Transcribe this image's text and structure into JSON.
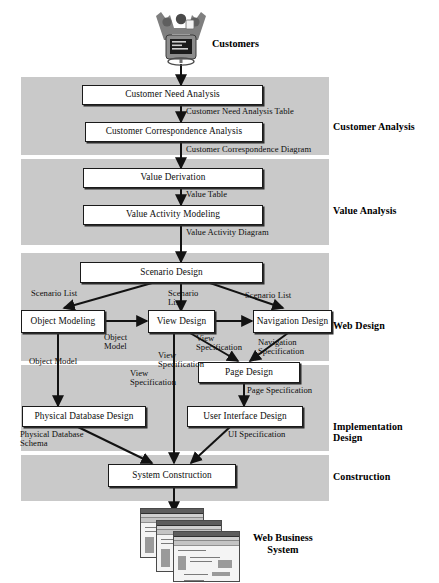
{
  "diagram": {
    "band_color": "#c9c9c9",
    "box_fill": "#ffffff",
    "line_color": "#1a1a1a"
  },
  "endpoints": {
    "top": {
      "label": "Customers",
      "icon": "customers-clipart-icon"
    },
    "bottom": {
      "label": "Web Business\nSystem",
      "icon": "stacked-windows-clipart-icon"
    }
  },
  "phases": [
    {
      "id": "customer-analysis",
      "label": "Customer Analysis"
    },
    {
      "id": "value-analysis",
      "label": "Value Analysis"
    },
    {
      "id": "web-design",
      "label": "Web Design"
    },
    {
      "id": "implementation-design",
      "label": "Implementation\nDesign"
    },
    {
      "id": "construction",
      "label": "Construction"
    }
  ],
  "processes": [
    {
      "id": "customer-need-analysis",
      "label": "Customer Need Analysis"
    },
    {
      "id": "customer-correspondence-analysis",
      "label": "Customer Correspondence Analysis"
    },
    {
      "id": "value-derivation",
      "label": "Value Derivation"
    },
    {
      "id": "value-activity-modeling",
      "label": "Value Activity Modeling"
    },
    {
      "id": "scenario-design",
      "label": "Scenario Design"
    },
    {
      "id": "object-modeling",
      "label": "Object Modeling"
    },
    {
      "id": "view-design",
      "label": "View Design"
    },
    {
      "id": "navigation-design",
      "label": "Navigation Design"
    },
    {
      "id": "page-design",
      "label": "Page Design"
    },
    {
      "id": "physical-database-design",
      "label": "Physical Database Design"
    },
    {
      "id": "user-interface-design",
      "label": "User Interface Design"
    },
    {
      "id": "system-construction",
      "label": "System Construction"
    }
  ],
  "artifacts": [
    {
      "id": "customer-need-analysis-table",
      "label": "Customer Need Analysis Table"
    },
    {
      "id": "customer-correspondence-diagram",
      "label": "Customer Correspondence Diagram"
    },
    {
      "id": "value-table",
      "label": "Value Table"
    },
    {
      "id": "value-activity-diagram",
      "label": "Value Activity Diagram"
    },
    {
      "id": "scenario-list-left",
      "label": "Scenario List"
    },
    {
      "id": "scenario-list-center",
      "label": "Scenario\nList"
    },
    {
      "id": "scenario-list-right",
      "label": "Scenario List"
    },
    {
      "id": "object-model-right",
      "label": "Object\nModel"
    },
    {
      "id": "object-model-down",
      "label": "Object Model"
    },
    {
      "id": "view-specification-right",
      "label": "View\nSpecification"
    },
    {
      "id": "view-specification-diag",
      "label": "View\nSpecification"
    },
    {
      "id": "view-specification-down",
      "label": "View\nSpecification"
    },
    {
      "id": "navigation-specification",
      "label": "Navigation\nSpecification"
    },
    {
      "id": "page-specification",
      "label": "Page Specification"
    },
    {
      "id": "physical-database-schema",
      "label": "Physical Database\nSchema"
    },
    {
      "id": "ui-specification",
      "label": "UI Specification"
    }
  ]
}
